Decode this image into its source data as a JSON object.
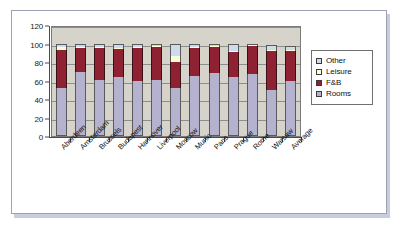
{
  "chart_data": {
    "type": "bar",
    "stacked": true,
    "title": "",
    "subtitle": "",
    "xlabel": "",
    "ylabel": "",
    "ylim": [
      0,
      120
    ],
    "ytick_values": [
      0,
      20,
      40,
      60,
      80,
      100,
      120
    ],
    "ytick_labels": [
      "0",
      "20",
      "40",
      "60",
      "80",
      "100",
      "120"
    ],
    "grid": true,
    "grid_axis": "y",
    "legend_position": "right",
    "categories": [
      "Aberdeen",
      "Amsterdam",
      "Brussels",
      "Budapest",
      "Hannover",
      "Liverpool",
      "Moscow",
      "Munic",
      "Paris",
      "Prague",
      "Rome",
      "Warsaw",
      "Average"
    ],
    "series": [
      {
        "name": "Rooms",
        "color": "#b4b2cf",
        "values": [
          52,
          69,
          61,
          64,
          59,
          61,
          52,
          65,
          68,
          64,
          67,
          50,
          60
        ]
      },
      {
        "name": "F&B",
        "color": "#8e2232",
        "values": [
          41,
          26,
          34,
          30,
          36,
          35,
          28,
          30,
          28,
          27,
          30,
          42,
          32
        ]
      },
      {
        "name": "Leisure",
        "color": "#ffffd4",
        "values": [
          3,
          1,
          1,
          1,
          1,
          1,
          6,
          1,
          1,
          1,
          1,
          1,
          1
        ]
      },
      {
        "name": "Other",
        "color": "#ccdcec",
        "values": [
          3,
          3,
          3,
          4,
          3,
          3,
          13,
          3,
          2,
          7,
          2,
          5,
          4
        ]
      }
    ],
    "totals": [
      99,
      99,
      99,
      99,
      99,
      100,
      99,
      99,
      99,
      99,
      100,
      98,
      97
    ]
  },
  "legend": {
    "items": [
      {
        "label": "Other",
        "color": "#ccdcec"
      },
      {
        "label": "Leisure",
        "color": "#ffffd4"
      },
      {
        "label": "F&B",
        "color": "#8e2232"
      },
      {
        "label": "Rooms",
        "color": "#b4b2cf"
      }
    ]
  },
  "colors": {
    "plot_background": "#d6d3ca",
    "page_background": "#ffffff",
    "axis": "#4a4a4a",
    "gridline": "#8d8d8d",
    "frame_border": "#9aa2b4",
    "frame_shadow": "#c8cddd"
  }
}
